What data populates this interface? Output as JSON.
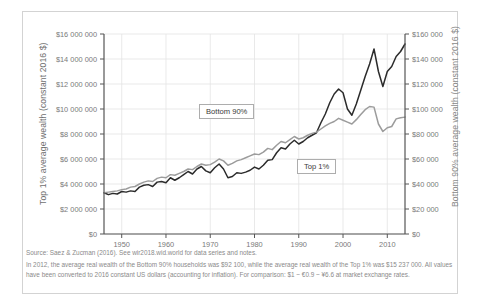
{
  "chart_data": {
    "type": "line",
    "title": "",
    "xlabel": "",
    "ylabel": "Top 1% average wealth (constant 2016 $)",
    "ylabel_right": "Bottom 90% average wealth (constant 2016 $)",
    "xlim": [
      1946,
      2014
    ],
    "ylim": [
      0,
      16000000
    ],
    "ylim_right": [
      0,
      160000
    ],
    "grid": true,
    "legend_position": "inline-callout",
    "x_ticks": [
      "1950",
      "1960",
      "1970",
      "1980",
      "1990",
      "2000",
      "2010"
    ],
    "x_tick_values": [
      1950,
      1960,
      1970,
      1980,
      1990,
      2000,
      2010
    ],
    "y_ticks_left": [
      "$0",
      "$2 000 000",
      "$4 000 000",
      "$6 000 000",
      "$8 000 000",
      "$10 000 000",
      "$12 000 000",
      "$14 000 000",
      "$16 000 000"
    ],
    "y_tick_values_left": [
      0,
      2000000,
      4000000,
      6000000,
      8000000,
      10000000,
      12000000,
      14000000,
      16000000
    ],
    "y_ticks_right": [
      "$0",
      "$20 000",
      "$40 000",
      "$60 000",
      "$80 000",
      "$100 000",
      "$120 000",
      "$140 000",
      "$160 000"
    ],
    "y_tick_values_right": [
      0,
      20000,
      40000,
      60000,
      80000,
      100000,
      120000,
      140000,
      160000
    ],
    "x": [
      1946,
      1947,
      1948,
      1949,
      1950,
      1951,
      1952,
      1953,
      1954,
      1955,
      1956,
      1957,
      1958,
      1959,
      1960,
      1961,
      1962,
      1963,
      1964,
      1965,
      1966,
      1967,
      1968,
      1969,
      1970,
      1971,
      1972,
      1973,
      1974,
      1975,
      1976,
      1977,
      1978,
      1979,
      1980,
      1981,
      1982,
      1983,
      1984,
      1985,
      1986,
      1987,
      1988,
      1989,
      1990,
      1991,
      1992,
      1993,
      1994,
      1995,
      1996,
      1997,
      1998,
      1999,
      2000,
      2001,
      2002,
      2003,
      2004,
      2005,
      2006,
      2007,
      2008,
      2009,
      2010,
      2011,
      2012,
      2013,
      2014
    ],
    "series": [
      {
        "name": "Top 1%",
        "color": "#2b2b2b",
        "axis": "left",
        "units": "constant 2016 $",
        "values": [
          3300000,
          3150000,
          3250000,
          3200000,
          3400000,
          3350000,
          3450000,
          3400000,
          3750000,
          3900000,
          3950000,
          3800000,
          4150000,
          4200000,
          4100000,
          4500000,
          4300000,
          4500000,
          4750000,
          5000000,
          4800000,
          5200000,
          5400000,
          5050000,
          4900000,
          5300000,
          5600000,
          5200000,
          4500000,
          4600000,
          4900000,
          4850000,
          4950000,
          5100000,
          5350000,
          5200000,
          5500000,
          5900000,
          5950000,
          6500000,
          6900000,
          6800000,
          7200000,
          7500000,
          7200000,
          7400000,
          7700000,
          7900000,
          8100000,
          8900000,
          9600000,
          10500000,
          11200000,
          11600000,
          11300000,
          10000000,
          9500000,
          10400000,
          11500000,
          12600000,
          13600000,
          14800000,
          13000000,
          11800000,
          13000000,
          13400000,
          14200000,
          14600000,
          15200000
        ]
      },
      {
        "name": "Bottom 90%",
        "color": "#9c9c9c",
        "axis": "right",
        "units": "constant 2016 $",
        "values": [
          33000,
          33500,
          34000,
          34500,
          35500,
          36000,
          37500,
          38000,
          40000,
          41500,
          42500,
          42000,
          44500,
          45500,
          45000,
          47500,
          47000,
          48500,
          50000,
          52000,
          51500,
          54000,
          56000,
          55000,
          55500,
          57500,
          60000,
          58500,
          55000,
          56500,
          58500,
          59500,
          61000,
          62500,
          64000,
          63500,
          65500,
          68500,
          67500,
          71000,
          74000,
          73000,
          75500,
          78000,
          76000,
          77000,
          79000,
          80500,
          81500,
          84000,
          86500,
          88500,
          90000,
          92500,
          91000,
          89500,
          88000,
          91500,
          95500,
          99500,
          102000,
          101500,
          88000,
          82000,
          85000,
          86000,
          92100,
          93000,
          93500
        ]
      }
    ]
  },
  "labels": {
    "bottom90": "Bottom 90%",
    "top1": "Top 1%"
  },
  "footnote": {
    "line1": "Source: Saez & Zucman (2016). See wir2018.wid.world for data series and notes.",
    "line2": "In 2012, the average real wealth of the Bottom 90% households was $92 100, while the average real wealth of the Top 1% was $15 237 000. All values have been converted to 2016 constant US dollars (accounting for inflation). For comparison: $1 ~ €0.9 ~ ¥6.6 at market exchange rates."
  }
}
